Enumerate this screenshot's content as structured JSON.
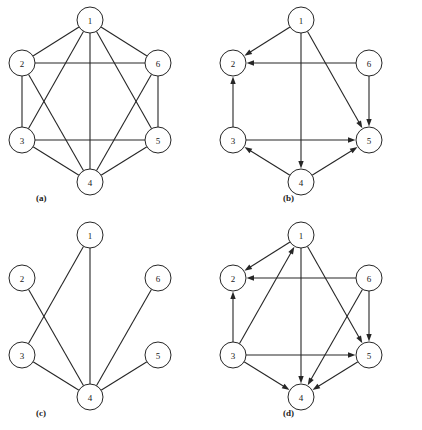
{
  "figure": {
    "background_color": "#ffffff",
    "line_color": "#262626",
    "node_fill": "#ffffff",
    "node_radius": 13,
    "panel_width": 211,
    "panel_height": 215
  },
  "node_labels": {
    "n1": "1",
    "n2": "2",
    "n3": "3",
    "n4": "4",
    "n5": "5",
    "n6": "6"
  },
  "node_positions": [
    {
      "id": "1",
      "x": 90,
      "y": 20
    },
    {
      "id": "2",
      "x": 22,
      "y": 63
    },
    {
      "id": "3",
      "x": 22,
      "y": 140
    },
    {
      "id": "4",
      "x": 90,
      "y": 182
    },
    {
      "id": "5",
      "x": 158,
      "y": 140
    },
    {
      "id": "6",
      "x": 158,
      "y": 63
    }
  ],
  "panels": [
    {
      "key": "a",
      "caption": "(a)",
      "caption_x": 36,
      "caption_y": 201,
      "origin_x": 0,
      "origin_y": 0,
      "directed": false,
      "edges": [
        {
          "from": "1",
          "to": "2"
        },
        {
          "from": "1",
          "to": "3"
        },
        {
          "from": "1",
          "to": "4"
        },
        {
          "from": "1",
          "to": "5"
        },
        {
          "from": "1",
          "to": "6"
        },
        {
          "from": "2",
          "to": "3"
        },
        {
          "from": "2",
          "to": "4"
        },
        {
          "from": "2",
          "to": "6"
        },
        {
          "from": "3",
          "to": "4"
        },
        {
          "from": "3",
          "to": "5"
        },
        {
          "from": "4",
          "to": "5"
        },
        {
          "from": "4",
          "to": "6"
        },
        {
          "from": "5",
          "to": "6"
        }
      ]
    },
    {
      "key": "b",
      "caption": "(b)",
      "caption_x": 72,
      "caption_y": 201,
      "origin_x": 211,
      "origin_y": 0,
      "directed": true,
      "edges": [
        {
          "from": "1",
          "to": "2"
        },
        {
          "from": "1",
          "to": "4"
        },
        {
          "from": "1",
          "to": "5"
        },
        {
          "from": "3",
          "to": "2"
        },
        {
          "from": "6",
          "to": "2"
        },
        {
          "from": "6",
          "to": "5"
        },
        {
          "from": "3",
          "to": "5"
        },
        {
          "from": "4",
          "to": "3"
        },
        {
          "from": "4",
          "to": "5"
        }
      ]
    },
    {
      "key": "c",
      "caption": "(c)",
      "caption_x": 36,
      "caption_y": 201,
      "origin_x": 0,
      "origin_y": 215,
      "directed": false,
      "edges": [
        {
          "from": "1",
          "to": "3"
        },
        {
          "from": "1",
          "to": "4"
        },
        {
          "from": "2",
          "to": "4"
        },
        {
          "from": "3",
          "to": "4"
        },
        {
          "from": "4",
          "to": "5"
        },
        {
          "from": "4",
          "to": "6"
        }
      ]
    },
    {
      "key": "d",
      "caption": "(d)",
      "caption_x": 72,
      "caption_y": 201,
      "origin_x": 211,
      "origin_y": 215,
      "directed": true,
      "edges": [
        {
          "from": "1",
          "to": "2"
        },
        {
          "from": "1",
          "to": "4"
        },
        {
          "from": "1",
          "to": "5"
        },
        {
          "from": "3",
          "to": "1"
        },
        {
          "from": "3",
          "to": "2"
        },
        {
          "from": "3",
          "to": "4"
        },
        {
          "from": "3",
          "to": "5"
        },
        {
          "from": "6",
          "to": "2"
        },
        {
          "from": "6",
          "to": "4"
        },
        {
          "from": "6",
          "to": "5"
        },
        {
          "from": "5",
          "to": "4"
        }
      ]
    }
  ]
}
